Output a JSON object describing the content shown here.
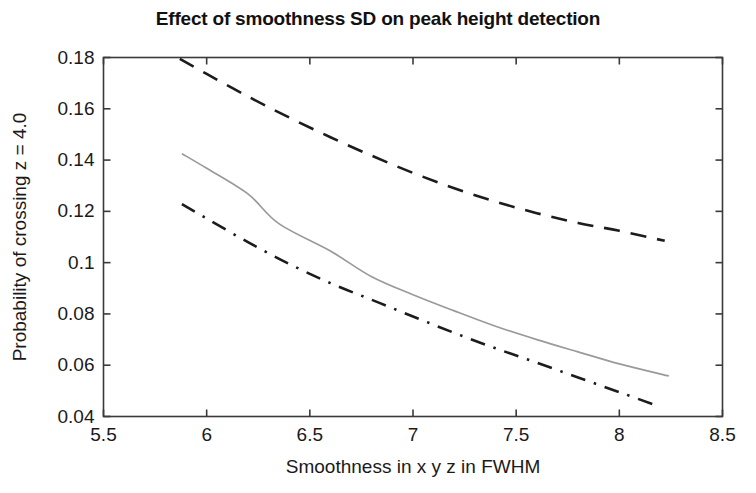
{
  "figure": {
    "title": "Effect of smoothness SD on peak height detection",
    "background_color": "#ffffff",
    "frame_color": "#3a3a3a"
  },
  "chart_data": {
    "type": "line",
    "title": "Effect of smoothness SD on peak height detection",
    "xlabel": "Smoothness in x y z in FWHM",
    "ylabel": "Probability of crossing z = 4.0",
    "xlim": [
      5.5,
      8.5
    ],
    "ylim": [
      0.04,
      0.18
    ],
    "xticks": [
      5.5,
      6,
      6.5,
      7,
      7.5,
      8,
      8.5
    ],
    "xtick_labels": [
      "5.5",
      "6",
      "6.5",
      "7",
      "7.5",
      "8",
      "8.5"
    ],
    "yticks": [
      0.04,
      0.06,
      0.08,
      0.1,
      0.12,
      0.14,
      0.16,
      0.18
    ],
    "ytick_labels": [
      "0.04",
      "0.06",
      "0.08",
      "0.1",
      "0.12",
      "0.14",
      "0.16",
      "0.18"
    ],
    "grid": false,
    "legend": null,
    "series": [
      {
        "name": "upper",
        "style": "dashed",
        "color": "#1c1c1c",
        "x": [
          5.87,
          6.0,
          6.2,
          6.4,
          6.6,
          6.8,
          7.0,
          7.2,
          7.4,
          7.6,
          7.8,
          8.0,
          8.22
        ],
        "y": [
          0.1795,
          0.1736,
          0.1648,
          0.1566,
          0.1489,
          0.1417,
          0.135,
          0.129,
          0.1238,
          0.1193,
          0.1155,
          0.1124,
          0.1085
        ]
      },
      {
        "name": "middle",
        "style": "solid",
        "color": "#9a9a9a",
        "x": [
          5.88,
          6.0,
          6.2,
          6.35,
          6.6,
          6.8,
          7.0,
          7.2,
          7.4,
          7.6,
          7.8,
          8.0,
          8.24
        ],
        "y": [
          0.1425,
          0.1368,
          0.1268,
          0.1152,
          0.1045,
          0.0945,
          0.0875,
          0.0812,
          0.0752,
          0.07,
          0.0652,
          0.0605,
          0.0558
        ]
      },
      {
        "name": "lower",
        "style": "dash-dot",
        "color": "#1c1c1c",
        "x": [
          5.88,
          6.0,
          6.2,
          6.4,
          6.6,
          6.8,
          7.0,
          7.2,
          7.4,
          7.6,
          7.8,
          8.0,
          8.2
        ],
        "y": [
          0.1228,
          0.1172,
          0.108,
          0.0995,
          0.092,
          0.0855,
          0.079,
          0.0726,
          0.0666,
          0.061,
          0.0552,
          0.0495,
          0.0437
        ]
      }
    ]
  }
}
